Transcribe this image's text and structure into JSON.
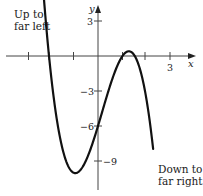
{
  "chart_data": {
    "type": "line",
    "title": "",
    "xlabel": "x",
    "ylabel": "y",
    "function": "f(x) = -(x+2)(x-1)(2x-3)",
    "x_ticks": [
      -3,
      -2,
      -1,
      1,
      2,
      3
    ],
    "x_tick_labels": [
      {
        "value": 3,
        "label": "3"
      }
    ],
    "y_ticks": [
      3,
      -3,
      -6,
      -9
    ],
    "y_tick_labels": [
      {
        "value": 3,
        "label": "3"
      },
      {
        "value": -3,
        "label": "−3"
      },
      {
        "value": -6,
        "label": "−6"
      },
      {
        "value": -9,
        "label": "−9"
      }
    ],
    "xlim": [
      -4,
      3.8
    ],
    "ylim": [
      -12,
      4.6
    ],
    "grid": false,
    "key_points": {
      "x_intercepts": [
        -2,
        1,
        1.5
      ],
      "y_intercept": -6,
      "local_min": [
        -1,
        -10
      ],
      "local_max": [
        1.25,
        0.3
      ]
    },
    "annotations": [
      {
        "text_lines": [
          "Up to",
          "far left"
        ],
        "position": "top-left"
      },
      {
        "text_lines": [
          "Down to",
          "far right"
        ],
        "position": "bottom-right"
      }
    ]
  },
  "labels": {
    "x_axis": "x",
    "y_axis": "y",
    "x3": "3",
    "y3": "3",
    "yneg3": "−3",
    "yneg6": "−6",
    "yneg9": "−9",
    "up_line1": "Up to",
    "up_line2": "far left",
    "down_line1": "Down to",
    "down_line2": "far right"
  }
}
